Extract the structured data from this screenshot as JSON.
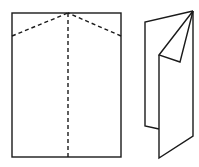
{
  "diagram": {
    "stroke_color": "#1a1a1a",
    "background": "#ffffff",
    "flat_sheet": {
      "outline": {
        "x": 12,
        "y": 13,
        "width": 109,
        "height": 144
      },
      "center_fold_x": 68,
      "diagonal_folds": [
        {
          "from": [
            12,
            36
          ],
          "to": [
            68,
            13
          ]
        },
        {
          "from": [
            121,
            36
          ],
          "to": [
            68,
            13
          ]
        }
      ],
      "fold_line_style": "dashed"
    },
    "folded_form": {
      "back_panel": [
        [
          145,
          22
        ],
        [
          193,
          11
        ],
        [
          193,
          136
        ],
        [
          158,
          129
        ],
        [
          145,
          126
        ]
      ],
      "front_panel": [
        [
          159,
          55
        ],
        [
          193,
          11
        ],
        [
          193,
          136
        ],
        [
          159,
          158
        ]
      ],
      "flap": [
        [
          193,
          11
        ],
        [
          159,
          55
        ],
        [
          180,
          62
        ]
      ]
    }
  }
}
